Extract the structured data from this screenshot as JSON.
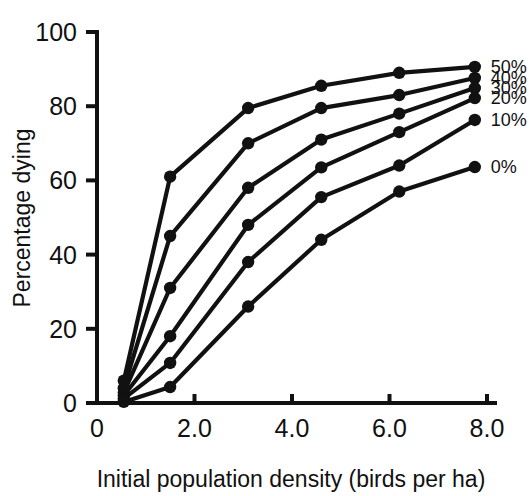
{
  "chart_data": {
    "type": "line",
    "title": "",
    "xlabel": "Initial population density (birds per ha)",
    "ylabel": "Percentage dying",
    "xlim": [
      0,
      8.0
    ],
    "ylim": [
      0,
      100
    ],
    "xticks": [
      "0",
      "2.0",
      "4.0",
      "6.0",
      "8.0"
    ],
    "xtick_values": [
      0,
      2.0,
      4.0,
      6.0,
      8.0
    ],
    "yticks": [
      "0",
      "20",
      "40",
      "60",
      "80",
      "100"
    ],
    "ytick_values": [
      0,
      20,
      40,
      60,
      80,
      100
    ],
    "grid": false,
    "legend_position": "right-inline-end-of-line",
    "x": [
      0.55,
      1.5,
      3.1,
      4.6,
      6.2,
      7.75
    ],
    "series": [
      {
        "name": "50%",
        "label": "50%",
        "values": [
          6.0,
          61.0,
          79.5,
          85.5,
          89.0,
          90.6
        ]
      },
      {
        "name": "40%",
        "label": "40%",
        "values": [
          4.0,
          45.0,
          70.0,
          79.5,
          83.0,
          87.6
        ]
      },
      {
        "name": "30%",
        "label": "30%",
        "values": [
          2.8,
          31.0,
          58.0,
          71.0,
          78.0,
          84.9
        ]
      },
      {
        "name": "20%",
        "label": "20%",
        "values": [
          2.0,
          18.0,
          48.0,
          63.5,
          73.0,
          82.2
        ]
      },
      {
        "name": "10%",
        "label": "10%",
        "values": [
          1.2,
          10.8,
          38.0,
          55.5,
          64.0,
          76.3
        ]
      },
      {
        "name": "0%",
        "label": "0%",
        "values": [
          0.3,
          4.3,
          26.0,
          44.0,
          57.0,
          63.6
        ]
      }
    ]
  },
  "figure": {
    "marker_shape": "filled-circle",
    "line_color": "#111111",
    "background_color": "#ffffff"
  }
}
